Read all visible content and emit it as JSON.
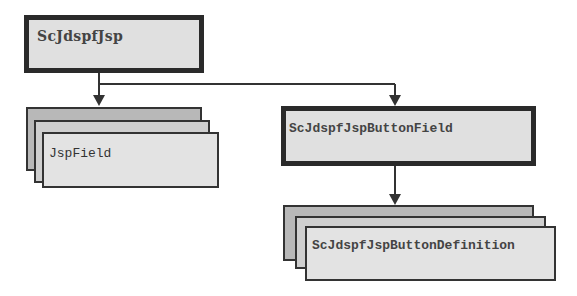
{
  "diagram": {
    "nodes": [
      {
        "id": "root",
        "label": "ScJdspfJsp",
        "style": "single-thick"
      },
      {
        "id": "field",
        "label": "JspField",
        "style": "stacked-multiple"
      },
      {
        "id": "button-field",
        "label": "ScJdspfJspButtonField",
        "style": "single-thick"
      },
      {
        "id": "button-definition",
        "label": "ScJdspfJspButtonDefinition",
        "style": "stacked-multiple"
      }
    ],
    "edges": [
      {
        "from": "root",
        "to": "field"
      },
      {
        "from": "root",
        "to": "button-field"
      },
      {
        "from": "button-field",
        "to": "button-definition"
      }
    ],
    "colors": {
      "box_fill": "#e0e0e0",
      "stack_back": "#b8b8b8",
      "stack_mid": "#cfcfcf",
      "border": "#2a2a2a",
      "line": "#333333"
    }
  }
}
